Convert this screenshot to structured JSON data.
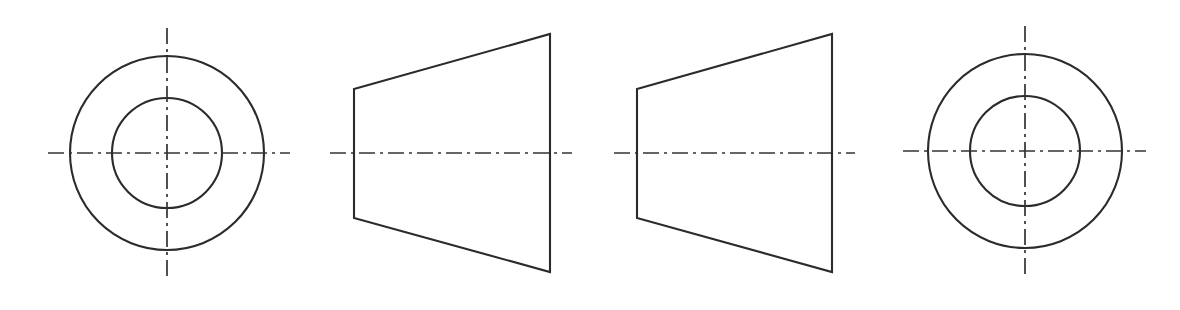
{
  "drawing": {
    "title": "Orthographic views of a truncated cone (frustum) bushing",
    "description": "Four engineering drawing views on a white field: two concentric-circle end views flanking two trapezoidal side views, each with dash-dot centerlines.",
    "canvas": {
      "width": 1180,
      "height": 310,
      "background": "#ffffff"
    },
    "style": {
      "outline_color": "#2b2b2b",
      "centerline_color": "#333333",
      "outline_width": 2.1,
      "centerline_width": 1.7,
      "centerline_dash_pattern": "16 5 3 5"
    },
    "views": [
      {
        "name": "end-view-left",
        "type": "concentric-circles",
        "label": "Left end view",
        "center": {
          "x": 167,
          "y": 153
        },
        "outer_radius": 97,
        "inner_radius": 55,
        "centerline_horizontal": {
          "x1": 48,
          "x2": 290,
          "y": 153
        },
        "centerline_vertical": {
          "y1": 28,
          "y2": 281,
          "x": 167
        }
      },
      {
        "name": "side-view-left",
        "type": "trapezoid",
        "label": "Left side view",
        "points": "354,89 550,34 550,272 354,218",
        "left_edge": {
          "x": 354,
          "y_top": 89,
          "y_bottom": 218
        },
        "right_edge": {
          "x": 550,
          "y_top": 34,
          "y_bottom": 272
        },
        "centerline_horizontal": {
          "x1": 330,
          "x2": 572,
          "y": 153
        }
      },
      {
        "name": "side-view-right",
        "type": "trapezoid",
        "label": "Right side view",
        "points": "637,89 832,34 832,272 637,218",
        "left_edge": {
          "x": 637,
          "y_top": 89,
          "y_bottom": 218
        },
        "right_edge": {
          "x": 832,
          "y_top": 34,
          "y_bottom": 272
        },
        "centerline_horizontal": {
          "x1": 614,
          "x2": 855,
          "y": 153
        }
      },
      {
        "name": "end-view-right",
        "type": "concentric-circles",
        "label": "Right end view",
        "center": {
          "x": 1025,
          "y": 151
        },
        "outer_radius": 97,
        "inner_radius": 55,
        "centerline_horizontal": {
          "x1": 903,
          "x2": 1146,
          "y": 151
        },
        "centerline_vertical": {
          "y1": 26,
          "y2": 279,
          "x": 1025
        }
      }
    ]
  }
}
